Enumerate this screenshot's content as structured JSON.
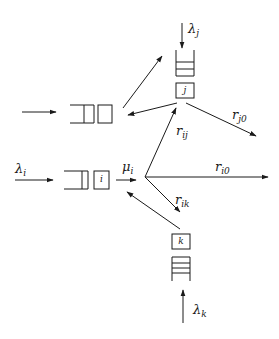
{
  "diagram": {
    "type": "queueing-network",
    "colors": {
      "stroke": "#1a1a1a",
      "background": "#ffffff"
    },
    "nodes": {
      "i": {
        "server_label": "i",
        "arrival": {
          "sym": "λ",
          "sub": "i"
        },
        "service": {
          "sym": "μ",
          "sub": "i"
        }
      },
      "j": {
        "server_label": "j",
        "arrival": {
          "sym": "λ",
          "sub": "j"
        }
      },
      "k": {
        "server_label": "k",
        "arrival": {
          "sym": "λ",
          "sub": "k"
        }
      },
      "other": {
        "server_label": ""
      }
    },
    "routing": {
      "r_ij": {
        "sym": "r",
        "sub": "ij"
      },
      "r_i0": {
        "sym": "r",
        "sub": "i0"
      },
      "r_ik": {
        "sym": "r",
        "sub": "ik"
      },
      "r_j0": {
        "sym": "r",
        "sub": "j0"
      }
    }
  }
}
